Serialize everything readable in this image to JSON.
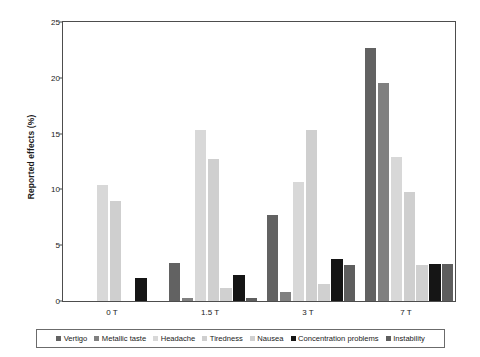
{
  "chart_data": {
    "type": "bar",
    "title": "",
    "subtitle": "",
    "xlabel": "",
    "ylabel": "Reported effects (%)",
    "categories": [
      "0 T",
      "1.5 T",
      "3 T",
      "7 T"
    ],
    "ylim": [
      0,
      25
    ],
    "yticks": [
      0,
      5,
      10,
      15,
      20,
      25
    ],
    "ytick_labels": [
      "0",
      "5",
      "10",
      "15",
      "20",
      "25"
    ],
    "grid": false,
    "legend_position": "bottom",
    "series": [
      {
        "name": "Vertigo",
        "color": "#626262",
        "values": [
          0,
          3.4,
          7.7,
          22.7
        ]
      },
      {
        "name": "Metallic taste",
        "color": "#808080",
        "values": [
          0,
          0.3,
          0.8,
          19.5
        ]
      },
      {
        "name": "Headache",
        "color": "#d8d8d8",
        "values": [
          10.4,
          15.3,
          10.7,
          12.9
        ]
      },
      {
        "name": "Tiredness",
        "color": "#cfcfcf",
        "values": [
          9.0,
          12.7,
          15.3,
          9.8
        ]
      },
      {
        "name": "Nausea",
        "color": "#d0d0d0",
        "values": [
          0,
          1.2,
          1.5,
          3.2
        ]
      },
      {
        "name": "Concentration problems",
        "color": "#151515",
        "values": [
          2.1,
          2.3,
          3.8,
          3.3
        ]
      },
      {
        "name": "Instability",
        "color": "#5e5e5e",
        "values": [
          0,
          0.3,
          3.2,
          3.3
        ]
      }
    ]
  },
  "axis": {
    "frame_color": "#4d4d4d",
    "tick_color": "#4d4d4d"
  },
  "legend": {
    "border_color": "#6b6b6b"
  }
}
